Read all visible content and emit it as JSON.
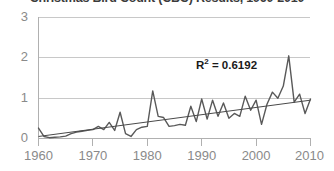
{
  "chart_data": {
    "type": "line",
    "title": "Christmas Bird Count (CBC) Results, 1960-2010",
    "xlabel": "",
    "ylabel": "",
    "xlim": [
      1960,
      2010
    ],
    "ylim": [
      0,
      3
    ],
    "grid": true,
    "legend": false,
    "y_ticks": [
      "0",
      "1",
      "2",
      "3"
    ],
    "y_tick_values": [
      0,
      1,
      2,
      3
    ],
    "x_ticks": [
      "1960",
      "1970",
      "1980",
      "1990",
      "2000",
      "2010"
    ],
    "x_tick_values": [
      1960,
      1970,
      1980,
      1990,
      2000,
      2010
    ],
    "annotations": [
      {
        "name": "r2-value",
        "text_prefix": "R",
        "text_sup": "2",
        "text_suffix": " = 0.6192",
        "full_text": "R2 = 0.6192",
        "x": 1995,
        "y": 1.85
      }
    ],
    "series": [
      {
        "name": "CBC count",
        "type": "line",
        "color": "#595959",
        "x": [
          1960,
          1961,
          1962,
          1963,
          1964,
          1965,
          1966,
          1967,
          1968,
          1969,
          1970,
          1971,
          1972,
          1973,
          1974,
          1975,
          1976,
          1977,
          1978,
          1979,
          1980,
          1981,
          1982,
          1983,
          1984,
          1985,
          1986,
          1987,
          1988,
          1989,
          1990,
          1991,
          1992,
          1993,
          1994,
          1995,
          1996,
          1997,
          1998,
          1999,
          2000,
          2001,
          2002,
          2003,
          2004,
          2005,
          2006,
          2007,
          2008,
          2009,
          2010
        ],
        "values": [
          0.26,
          0.05,
          0.02,
          0.03,
          0.04,
          0.06,
          0.12,
          0.16,
          0.18,
          0.2,
          0.22,
          0.3,
          0.22,
          0.4,
          0.2,
          0.65,
          0.12,
          0.05,
          0.22,
          0.28,
          0.3,
          1.18,
          0.55,
          0.52,
          0.3,
          0.32,
          0.35,
          0.33,
          0.8,
          0.42,
          0.98,
          0.48,
          0.95,
          0.55,
          0.88,
          0.5,
          0.62,
          0.55,
          1.05,
          0.7,
          0.95,
          0.35,
          0.85,
          1.15,
          1.0,
          1.3,
          2.05,
          0.9,
          1.1,
          0.62,
          0.98
        ]
      },
      {
        "name": "Linear trendline",
        "type": "line",
        "color": "#4a4a4a",
        "x": [
          1960,
          2010
        ],
        "values": [
          0.05,
          0.95
        ],
        "r_squared": 0.6192
      }
    ]
  }
}
